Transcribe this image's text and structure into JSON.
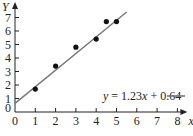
{
  "chart_data": {
    "type": "scatter",
    "title": "",
    "xlabel": "x",
    "ylabel": "Y",
    "xlim": [
      0,
      8
    ],
    "ylim": [
      0,
      7.5
    ],
    "x_ticks": [
      "0",
      "1",
      "2",
      "3",
      "4",
      "5",
      "6",
      "7",
      "8"
    ],
    "y_ticks": [
      "0",
      "1",
      "2",
      "3",
      "4",
      "5",
      "6",
      "7"
    ],
    "grid": false,
    "series": [
      {
        "name": "data points",
        "type": "scatter",
        "points": [
          {
            "x": 1,
            "y": 1.7
          },
          {
            "x": 2,
            "y": 3.4
          },
          {
            "x": 3,
            "y": 4.8
          },
          {
            "x": 4,
            "y": 5.4
          },
          {
            "x": 4.5,
            "y": 6.7
          },
          {
            "x": 5,
            "y": 6.7
          }
        ]
      },
      {
        "name": "fit line",
        "type": "line",
        "equation": "y = 1.23x + 0.64",
        "slope": 1.23,
        "intercept": 0.64,
        "x_range": [
          0,
          5.5
        ]
      }
    ],
    "legend": {
      "text": "y = 1.23x + 0.64",
      "position": "lower right"
    }
  },
  "labels": {
    "y_axis": "Y",
    "x_axis": "x",
    "equation_prefix": "y",
    "equation_mid": " = 1.23",
    "equation_var": "x",
    "equation_suffix": " + 0.64"
  },
  "colors": {
    "axis": "#222222",
    "points": "#111111",
    "fit_line": "#777777"
  }
}
